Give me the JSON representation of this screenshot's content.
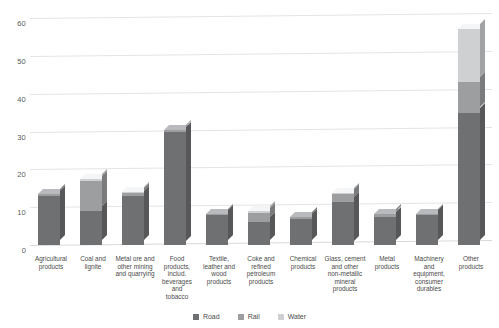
{
  "chart_data": {
    "type": "bar",
    "subtype": "stacked-column-3d",
    "title": "",
    "xlabel": "",
    "ylabel": "",
    "ylim": [
      0,
      60
    ],
    "yticks": [
      0,
      10,
      20,
      30,
      40,
      50,
      60
    ],
    "grid": true,
    "legend_position": "bottom-center",
    "categories": [
      "Agricultural products",
      "Coal and lignite",
      "Metal ore and other mining and quarrying",
      "Food products, includ. beverages and tobacco",
      "Textile, leather and wood products",
      "Coke and refined petroleum products",
      "Chemical products",
      "Glass, cement and other non-metallic mineral products",
      "Metal products",
      "Machinery and equipment, consumer durables",
      "Other products"
    ],
    "category_lines": [
      [
        "Agricultural",
        "products"
      ],
      [
        "Coal and",
        "lignite"
      ],
      [
        "Metal ore and",
        "other mining",
        "and quarrying"
      ],
      [
        "Food",
        "products,",
        "includ.",
        "beverages and",
        "tobacco"
      ],
      [
        "Textile,",
        "leather and",
        "wood",
        "products"
      ],
      [
        "Coke and",
        "refined",
        "petroleum",
        "products"
      ],
      [
        "Chemical",
        "products"
      ],
      [
        "Glass, cement",
        "and other",
        "non-metallic",
        "mineral",
        "products"
      ],
      [
        "Metal",
        "products"
      ],
      [
        "Machinery",
        "and",
        "equipment,",
        "consumer",
        "durables"
      ],
      [
        "Other",
        "products"
      ]
    ],
    "series": [
      {
        "name": "Road",
        "color": "#6f7072",
        "values": [
          13.0,
          9.0,
          13.0,
          30.0,
          8.0,
          6.0,
          7.0,
          11.5,
          7.5,
          8.0,
          35.0
        ]
      },
      {
        "name": "Rail",
        "color": "#9d9ea0",
        "values": [
          0.5,
          8.0,
          0.8,
          0.3,
          0.2,
          2.5,
          0.4,
          2.0,
          0.6,
          0.3,
          8.0
        ]
      },
      {
        "name": "Water",
        "color": "#cfd0d1",
        "values": [
          0.0,
          0.5,
          0.3,
          0.0,
          0.0,
          0.5,
          0.0,
          0.3,
          0.0,
          0.0,
          14.0
        ]
      }
    ],
    "totals": [
      13.5,
      17.5,
      14.1,
      30.3,
      8.2,
      9.0,
      7.4,
      13.8,
      8.1,
      8.3,
      57.0
    ]
  },
  "legend": {
    "items": [
      {
        "label": "Road",
        "color": "#6f7072"
      },
      {
        "label": "Rail",
        "color": "#9d9ea0"
      },
      {
        "label": "Water",
        "color": "#cfd0d1"
      }
    ]
  }
}
